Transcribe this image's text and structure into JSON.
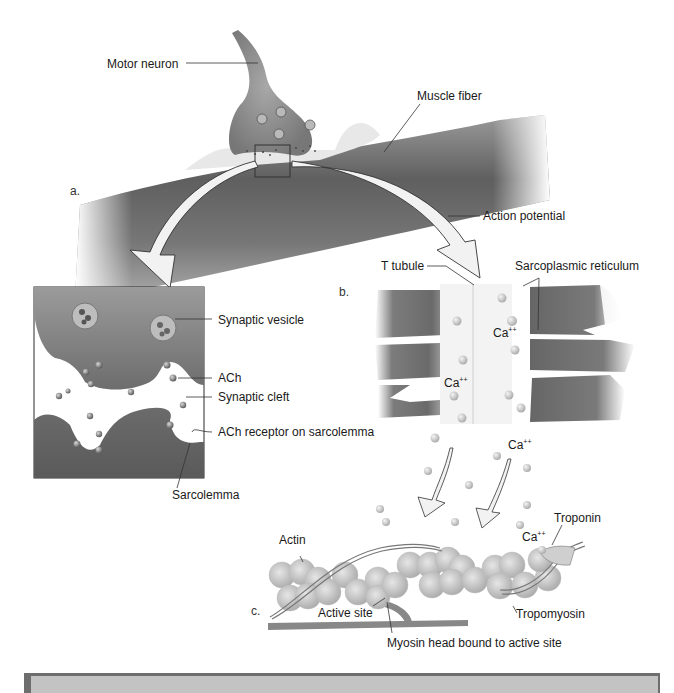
{
  "figure": {
    "panels": [
      {
        "id": "a",
        "label": "a."
      },
      {
        "id": "b",
        "label": "b."
      },
      {
        "id": "c",
        "label": "c."
      }
    ],
    "labels": {
      "motor_neuron": "Motor neuron",
      "muscle_fiber": "Muscle fiber",
      "action_potential": "Action potential",
      "synaptic_vesicle": "Synaptic vesicle",
      "ach": "ACh",
      "synaptic_cleft": "Synaptic cleft",
      "ach_receptor": "ACh receptor on sarcolemma",
      "sarcolemma": "Sarcolemma",
      "t_tubule": "T tubule",
      "sarcoplasmic_reticulum": "Sarcoplasmic reticulum",
      "calcium": "Ca",
      "calcium_charge": "++",
      "actin": "Actin",
      "troponin": "Troponin",
      "active_site": "Active site",
      "tropomyosin": "Tropomyosin",
      "myosin_head": "Myosin head bound to active site"
    },
    "colors": {
      "muscle_dark": "#5f5f5f",
      "muscle_mid": "#8a8a8a",
      "neuron": "#8d8d8d",
      "arrow_fill": "#f2f2f2",
      "footer_fill": "#c3c3c3",
      "footer_border": "#6e6e6e"
    }
  }
}
